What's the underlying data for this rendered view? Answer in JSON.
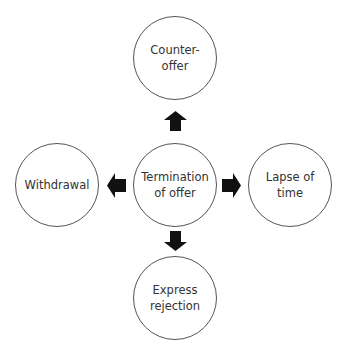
{
  "diagram": {
    "title": "Termination of offer",
    "center": {
      "label": "Termination\nof offer"
    },
    "branches": [
      {
        "direction": "up",
        "label": "Counter-\noffer"
      },
      {
        "direction": "left",
        "label": "Withdrawal"
      },
      {
        "direction": "right",
        "label": "Lapse of\ntime"
      },
      {
        "direction": "down",
        "label": "Express\nrejection"
      }
    ],
    "arrow_icon": "block-arrow-icon",
    "colors": {
      "circle_stroke": "#555555",
      "arrow_fill": "#111111",
      "text": "#333333",
      "background": "#ffffff"
    }
  }
}
